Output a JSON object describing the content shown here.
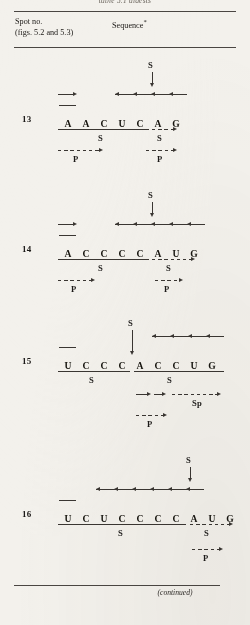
{
  "page": {
    "running_head": "table 5.1 digests",
    "continued_note": "(continued)",
    "ink_color": "#1c1a18",
    "rule_color": "#4a4642",
    "paper_color": "#f3f1ec"
  },
  "header": {
    "col_spot_line1": "Spot no.",
    "col_spot_line2": "(figs. 5.2 and 5.3)",
    "col_sequence": "Sequence",
    "col_sequence_marker": "*"
  },
  "labels": {
    "S": "S",
    "P": "P",
    "Sp": "Sp"
  },
  "rows": [
    {
      "spot_no": "13",
      "bases": [
        "A",
        "A",
        "C",
        "U",
        "C",
        "A",
        "G"
      ],
      "above_marker": "S",
      "upper_left_label": "",
      "under_labels": [
        "S",
        "S"
      ],
      "lower_labels": [
        "P",
        "P"
      ]
    },
    {
      "spot_no": "14",
      "bases": [
        "A",
        "C",
        "C",
        "C",
        "C",
        "A",
        "U",
        "G"
      ],
      "above_marker": "S",
      "upper_left_label": "",
      "under_labels": [
        "S",
        "S"
      ],
      "lower_labels": [
        "P",
        "P"
      ]
    },
    {
      "spot_no": "15",
      "bases": [
        "U",
        "C",
        "C",
        "C",
        "A",
        "C",
        "C",
        "U",
        "G"
      ],
      "above_marker": "S",
      "upper_left_label": "",
      "under_labels": [
        "S",
        "S"
      ],
      "lower_labels": [
        "Sp",
        "P"
      ]
    },
    {
      "spot_no": "16",
      "bases": [
        "U",
        "C",
        "U",
        "C",
        "C",
        "C",
        "C",
        "A",
        "U",
        "G"
      ],
      "above_marker": "S",
      "upper_left_label": "",
      "under_labels": [
        "S",
        "S"
      ],
      "lower_labels": [
        "P"
      ]
    }
  ]
}
